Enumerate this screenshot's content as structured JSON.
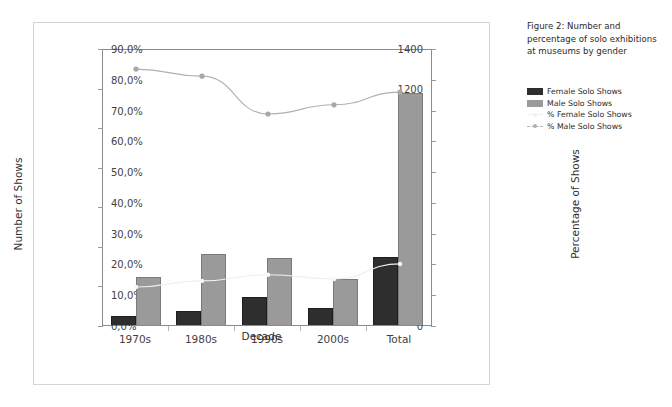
{
  "caption": {
    "text": "Figure 2: Number and percentage of solo exhibitions at museums by gender"
  },
  "legend": {
    "items": [
      {
        "label": "Female Solo Shows",
        "marker": "bar-swatch",
        "color": "#2e2e2e"
      },
      {
        "label": "Male Solo Shows",
        "marker": "bar-swatch",
        "color": "#9a9a9a"
      },
      {
        "label": "% Female Solo Shows",
        "marker": "line-marker",
        "color": "#efefef"
      },
      {
        "label": "% Male Solo Shows",
        "marker": "line-marker-dashed",
        "color": "#b0b0b0"
      }
    ]
  },
  "chart_data": {
    "type": "bar",
    "title": "",
    "categories": [
      "1970s",
      "1980s",
      "1990s",
      "2000s",
      "Total"
    ],
    "xlabel": "Decade",
    "ylabel": "Number of Shows",
    "y2label": "Percentage of Shows",
    "ylim": [
      0,
      1400
    ],
    "y2lim": [
      0,
      90
    ],
    "yticks": [
      0,
      200,
      400,
      600,
      800,
      1000,
      1200,
      1400
    ],
    "ytick_labels": [
      "0",
      "200",
      "400",
      "600",
      "800",
      "1000",
      "1200",
      "1400"
    ],
    "y2ticks": [
      0,
      10,
      20,
      30,
      40,
      50,
      60,
      70,
      80,
      90
    ],
    "y2tick_labels": [
      "0,0%",
      "10,0%",
      "20,0%",
      "30,0%",
      "40,0%",
      "50,0%",
      "60,0%",
      "70,0%",
      "80,0%",
      "90,0%"
    ],
    "grid": false,
    "legend_position": "right-outside",
    "series": [
      {
        "name": "Female Solo Shows",
        "kind": "bar",
        "axis": "left",
        "color": "#2e2e2e",
        "values": [
          45,
          72,
          140,
          85,
          342
        ]
      },
      {
        "name": "Male Solo Shows",
        "kind": "bar",
        "axis": "left",
        "color": "#9a9a9a",
        "values": [
          242,
          358,
          340,
          232,
          1175
        ]
      },
      {
        "name": "% Female Solo Shows",
        "kind": "line",
        "axis": "right",
        "color": "#efefef",
        "values": [
          13.0,
          15.0,
          17.0,
          15.6,
          20.5
        ]
      },
      {
        "name": "% Male Solo Shows",
        "kind": "line",
        "axis": "right",
        "color": "#b0b0b0",
        "values": [
          83.8,
          81.5,
          69.2,
          72.2,
          76.3
        ]
      }
    ]
  }
}
